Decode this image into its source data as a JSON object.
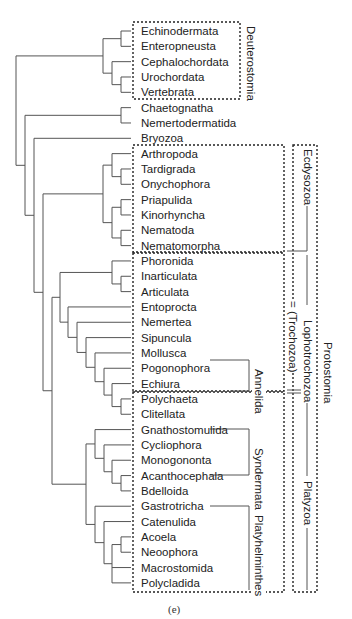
{
  "figure": {
    "caption": "(e)",
    "line_color": "#555555",
    "dash_color": "#222222"
  },
  "taxa": [
    "Echinodermata",
    "Enteropneusta",
    "Cephalochordata",
    "Urochordata",
    "Vertebrata",
    "Chaetognatha",
    "Nemertodermatida",
    "Bryozoa",
    "Arthropoda",
    "Tardigrada",
    "Onychophora",
    "Priapulida",
    "Kinorhyncha",
    "Nematoda",
    "Nematomorpha",
    "Phoronida",
    "Inarticulata",
    "Articulata",
    "Entoprocta",
    "Nemertea",
    "Sipuncula",
    "Mollusca",
    "Pogonophora",
    "Echiura",
    "Polychaeta",
    "Clitellata",
    "Gnathostomulida",
    "Cycliophora",
    "Monogononta",
    "Acanthocephala",
    "Bdelloida",
    "Gastrotricha",
    "Catenulida",
    "Acoela",
    "Neoophora",
    "Macrostomida",
    "Polycladida"
  ],
  "groups": {
    "deuterostomia": "Deuterostomia",
    "ecdysozoa": "Ecdysozoa",
    "lophotrochozoa": "Lophotrochozoa",
    "trochozoa": "= (Trochozoa)",
    "protostomia": "Protostomia",
    "annelida": "Annelida",
    "syndermata": "Syndermata",
    "platyhelminthes": "Platyhelminthes",
    "platyzoa": "Platyzoa"
  }
}
